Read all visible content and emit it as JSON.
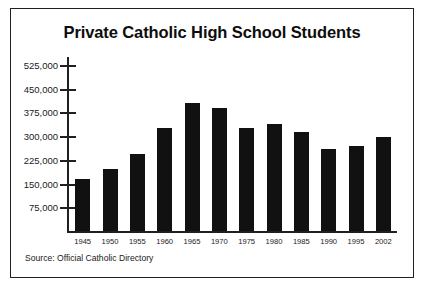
{
  "figure": {
    "title": "Private Catholic High School Students",
    "source_note": "Source: Official Catholic Directory",
    "border_color": "#231f20",
    "bar_color": "#111111",
    "background": "#ffffff"
  },
  "chart_data": {
    "type": "bar",
    "title": "Private Catholic High School Students",
    "xlabel": "",
    "ylabel": "",
    "categories": [
      "1945",
      "1950",
      "1955",
      "1960",
      "1965",
      "1970",
      "1975",
      "1980",
      "1985",
      "1990",
      "1995",
      "2002"
    ],
    "values": [
      163000,
      197000,
      243000,
      326000,
      404000,
      390000,
      327000,
      337000,
      314000,
      258000,
      268000,
      298000
    ],
    "ylim": [
      0,
      550000
    ],
    "ytick_values": [
      75000,
      150000,
      225000,
      300000,
      375000,
      450000,
      525000
    ],
    "ytick_labels": [
      "75,000",
      "150,000",
      "225,000",
      "300,000",
      "375,000",
      "450,000",
      "525,000"
    ],
    "grid": false,
    "legend": false,
    "annotations": [
      "Source: Official Catholic Directory"
    ]
  }
}
